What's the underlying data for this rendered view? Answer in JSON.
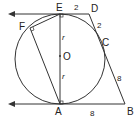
{
  "diagram": {
    "type": "geometry",
    "points": {
      "E": "E",
      "D": "D",
      "F": "F",
      "O": "O",
      "C": "C",
      "A": "A",
      "B": "B"
    },
    "lengths": {
      "ED": "2",
      "DC": "2",
      "CB": "8",
      "AB": "8"
    },
    "radius_labels": {
      "upper": "r",
      "lower": "r"
    },
    "colors": {
      "stroke": "#333333",
      "text": "#222222",
      "background": "#ffffff"
    }
  }
}
